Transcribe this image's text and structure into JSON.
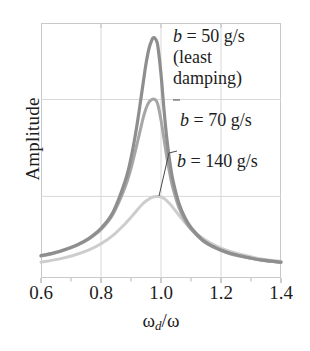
{
  "chart_data": {
    "type": "line",
    "title": "",
    "subtitle": "",
    "xlabel": "ωd/ω",
    "ylabel": "Amplitude",
    "xlim": [
      0.6,
      1.4
    ],
    "ylim": [
      0,
      1.0
    ],
    "grid": true,
    "grid_x": [
      0.8,
      1.0,
      1.2
    ],
    "grid_y": [
      0.7,
      0.32
    ],
    "legend_position": "inline-annotations",
    "x_major_ticks": [
      0.6,
      0.8,
      1.0,
      1.2,
      1.4
    ],
    "x_major_tick_labels": [
      "0.6",
      "0.8",
      "1.0",
      "1.2",
      "1.4"
    ],
    "x_minor_ticks": [
      0.7,
      0.9,
      1.1,
      1.3
    ],
    "y_tick_labels": [],
    "x": [
      0.6,
      0.64,
      0.68,
      0.72,
      0.76,
      0.8,
      0.84,
      0.88,
      0.9,
      0.92,
      0.94,
      0.95,
      0.96,
      0.97,
      0.975,
      0.98,
      0.985,
      0.99,
      1.0,
      1.01,
      1.02,
      1.03,
      1.04,
      1.06,
      1.08,
      1.1,
      1.14,
      1.18,
      1.22,
      1.26,
      1.3,
      1.34,
      1.4
    ],
    "series": [
      {
        "name": "b = 50 g/s",
        "label": "b = 50 g/s (least damping)",
        "color": "#8e8e8e",
        "linewidth": 3.2,
        "peak_x": 0.985,
        "peak_y": 0.94,
        "values": [
          0.088,
          0.098,
          0.112,
          0.13,
          0.156,
          0.195,
          0.258,
          0.378,
          0.47,
          0.6,
          0.76,
          0.84,
          0.9,
          0.935,
          0.942,
          0.94,
          0.93,
          0.905,
          0.8,
          0.66,
          0.54,
          0.45,
          0.382,
          0.292,
          0.236,
          0.198,
          0.148,
          0.12,
          0.101,
          0.088,
          0.078,
          0.07,
          0.062
        ]
      },
      {
        "name": "b = 70 g/s",
        "label": "b = 70 g/s",
        "color": "#a6a6a6",
        "linewidth": 3.0,
        "peak_x": 0.985,
        "peak_y": 0.7,
        "values": [
          0.086,
          0.096,
          0.11,
          0.128,
          0.153,
          0.19,
          0.25,
          0.355,
          0.43,
          0.525,
          0.625,
          0.665,
          0.69,
          0.7,
          0.702,
          0.7,
          0.693,
          0.678,
          0.62,
          0.545,
          0.47,
          0.405,
          0.352,
          0.276,
          0.226,
          0.191,
          0.145,
          0.118,
          0.099,
          0.086,
          0.077,
          0.069,
          0.061
        ]
      },
      {
        "name": "b = 140 g/s",
        "label": "b = 140 g/s",
        "color": "#cdcdcd",
        "linewidth": 3.0,
        "peak_x": 0.995,
        "peak_y": 0.32,
        "values": [
          0.062,
          0.07,
          0.08,
          0.093,
          0.11,
          0.134,
          0.167,
          0.212,
          0.238,
          0.266,
          0.292,
          0.302,
          0.31,
          0.316,
          0.318,
          0.319,
          0.32,
          0.32,
          0.318,
          0.312,
          0.302,
          0.29,
          0.276,
          0.246,
          0.218,
          0.193,
          0.155,
          0.128,
          0.108,
          0.094,
          0.083,
          0.074,
          0.065
        ]
      }
    ]
  },
  "annotations": {
    "ann_50": {
      "line1_var": "b",
      "line1_rest": " = 50 g/s",
      "line2": "(least",
      "line3": "damping)"
    },
    "ann_70": {
      "var": "b",
      "rest": " = 70 g/s"
    },
    "ann_140": {
      "var": "b",
      "rest": " = 140 g/s"
    }
  },
  "axes": {
    "y_label": "Amplitude",
    "x_label_num": "ω",
    "x_label_sub": "d",
    "x_label_den": "/ω",
    "x_tick_0": "0.6",
    "x_tick_1": "0.8",
    "x_tick_2": "1.0",
    "x_tick_3": "1.2",
    "x_tick_4": "1.4"
  },
  "colors": {
    "curve_50": "#8e8e8e",
    "curve_70": "#a6a6a6",
    "curve_140": "#cdcdcd",
    "grid": "#d8d8d8",
    "frame": "#c9c9c9",
    "text": "#1d1d1d"
  }
}
